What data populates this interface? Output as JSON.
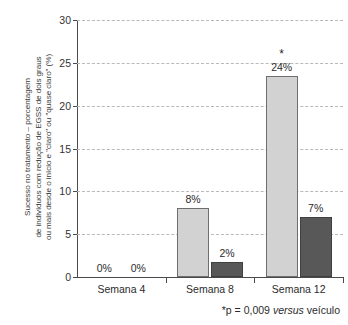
{
  "chart_data": {
    "type": "bar",
    "title": "",
    "subtitle": "",
    "categories": [
      "Semana 4",
      "Semana 8",
      "Semana 12"
    ],
    "series": [
      {
        "name": "light",
        "values": [
          0,
          8,
          24
        ],
        "plotted_values": [
          0,
          8.0,
          23.5
        ],
        "labels": [
          "0%",
          "8%",
          "24%"
        ],
        "color": "#d2d2d2"
      },
      {
        "name": "dark",
        "values": [
          0,
          2,
          7
        ],
        "plotted_values": [
          0,
          1.8,
          7.0
        ],
        "labels": [
          "0%",
          "2%",
          "7%"
        ],
        "color": "#585858"
      }
    ],
    "xlabel": "",
    "ylabel": "Sucesso no tratamento – porcentagem de indivíduos com redução de EGSS de dois graus ou mais desde o início e \"claro\" ou \"quase claro\" (%)",
    "ylabel_lines": [
      "Sucesso no tratamento – porcentagem",
      "de indivíduos com redução de EGSS de dois graus",
      "ou mais desde o início e \"claro\" ou \"quase claro\" (%)"
    ],
    "ylim": [
      0,
      30
    ],
    "yticks": [
      0,
      5,
      10,
      15,
      20,
      25,
      30
    ],
    "ytick_labels": [
      "0",
      "5",
      "10",
      "15",
      "20",
      "25",
      "30"
    ],
    "grid": true,
    "grid_style": "dashed",
    "legend": null,
    "annotations": [
      {
        "text": "*",
        "name": "significance-asterisk",
        "category": "Semana 12",
        "series": "light"
      }
    ],
    "footnote": {
      "prefix": "*p = 0,009 ",
      "emphasis": "versus",
      "suffix": " veículo",
      "full": "*p = 0,009 versus veículo"
    }
  },
  "colors": {
    "light_bar": "#d2d2d2",
    "dark_bar": "#585858",
    "axis": "#4a4a4a",
    "grid": "#b9b9b9",
    "text": "#2b2b2b"
  }
}
